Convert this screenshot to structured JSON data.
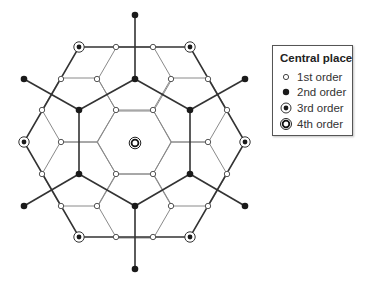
{
  "legend": {
    "title": "Central place",
    "items": [
      {
        "label": "1st order",
        "symbol": "open-circle"
      },
      {
        "label": "2nd order",
        "symbol": "filled-circle"
      },
      {
        "label": "3rd order",
        "symbol": "ringed-dot"
      },
      {
        "label": "4th order",
        "symbol": "double-ring"
      }
    ]
  },
  "colors": {
    "thin_line": "#8a8a8a",
    "thick_line": "#333333",
    "node_fill_dark": "#1a1a1a",
    "node_fill_light": "#ffffff"
  },
  "diagram": {
    "center": [
      135,
      143
    ],
    "first_order": [
      [
        116,
        47
      ],
      [
        153,
        47
      ],
      [
        61,
        79
      ],
      [
        97,
        79
      ],
      [
        171,
        79
      ],
      [
        208,
        79
      ],
      [
        42,
        110
      ],
      [
        116,
        110
      ],
      [
        153,
        110
      ],
      [
        227,
        110
      ],
      [
        61,
        142
      ],
      [
        208,
        142
      ],
      [
        42,
        174
      ],
      [
        116,
        174
      ],
      [
        153,
        174
      ],
      [
        227,
        174
      ],
      [
        61,
        206
      ],
      [
        97,
        206
      ],
      [
        171,
        206
      ],
      [
        208,
        206
      ],
      [
        116,
        237
      ],
      [
        153,
        237
      ]
    ],
    "second_order": [
      [
        135,
        79
      ],
      [
        79,
        110
      ],
      [
        190,
        110
      ],
      [
        79,
        174
      ],
      [
        190,
        174
      ],
      [
        135,
        206
      ],
      [
        135,
        15
      ],
      [
        24,
        79
      ],
      [
        245,
        79
      ],
      [
        24,
        206
      ],
      [
        245,
        206
      ],
      [
        135,
        269
      ]
    ],
    "third_order": [
      [
        79,
        47
      ],
      [
        190,
        47
      ],
      [
        24,
        142
      ],
      [
        245,
        142
      ],
      [
        79,
        237
      ],
      [
        190,
        237
      ]
    ],
    "fourth_order": [
      [
        135,
        143
      ]
    ]
  }
}
